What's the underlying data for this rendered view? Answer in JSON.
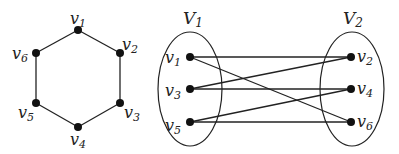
{
  "hexagon_graph": {
    "nodes": [
      {
        "id": "v1",
        "label": "v",
        "sub": "1",
        "x": 78,
        "y": 30,
        "lx": 70,
        "ly": 24
      },
      {
        "id": "v2",
        "label": "v",
        "sub": "2",
        "x": 120,
        "y": 53,
        "lx": 122,
        "ly": 50
      },
      {
        "id": "v3",
        "label": "v",
        "sub": "3",
        "x": 120,
        "y": 103,
        "lx": 124,
        "ly": 118
      },
      {
        "id": "v4",
        "label": "v",
        "sub": "4",
        "x": 78,
        "y": 127,
        "lx": 70,
        "ly": 145
      },
      {
        "id": "v5",
        "label": "v",
        "sub": "5",
        "x": 36,
        "y": 103,
        "lx": 18,
        "ly": 118
      },
      {
        "id": "v6",
        "label": "v",
        "sub": "6",
        "x": 36,
        "y": 53,
        "lx": 12,
        "ly": 59
      }
    ],
    "edges": [
      [
        "v1",
        "v2"
      ],
      [
        "v2",
        "v3"
      ],
      [
        "v3",
        "v4"
      ],
      [
        "v4",
        "v5"
      ],
      [
        "v5",
        "v6"
      ],
      [
        "v6",
        "v1"
      ]
    ]
  },
  "bipartite_graph": {
    "sets": [
      {
        "id": "V1",
        "label": "V",
        "sub": "1",
        "cx": 190,
        "cy": 89,
        "rx": 32,
        "ry": 57,
        "lx": 183,
        "ly": 24
      },
      {
        "id": "V2",
        "label": "V",
        "sub": "2",
        "cx": 352,
        "cy": 89,
        "rx": 32,
        "ry": 57,
        "lx": 343,
        "ly": 24
      }
    ],
    "nodes": [
      {
        "id": "v1",
        "label": "v",
        "sub": "1",
        "x": 190,
        "y": 57,
        "lx": 165,
        "ly": 63
      },
      {
        "id": "v3",
        "label": "v",
        "sub": "3",
        "x": 190,
        "y": 89,
        "lx": 165,
        "ly": 96
      },
      {
        "id": "v5",
        "label": "v",
        "sub": "5",
        "x": 190,
        "y": 122,
        "lx": 165,
        "ly": 131
      },
      {
        "id": "v2",
        "label": "v",
        "sub": "2",
        "x": 351,
        "y": 57,
        "lx": 357,
        "ly": 62
      },
      {
        "id": "v4",
        "label": "v",
        "sub": "4",
        "x": 351,
        "y": 89,
        "lx": 357,
        "ly": 94
      },
      {
        "id": "v6",
        "label": "v",
        "sub": "6",
        "x": 351,
        "y": 122,
        "lx": 357,
        "ly": 127
      }
    ],
    "edges": [
      [
        "v1",
        "v2"
      ],
      [
        "v1",
        "v6"
      ],
      [
        "v3",
        "v2"
      ],
      [
        "v3",
        "v4"
      ],
      [
        "v5",
        "v4"
      ],
      [
        "v5",
        "v6"
      ]
    ]
  }
}
